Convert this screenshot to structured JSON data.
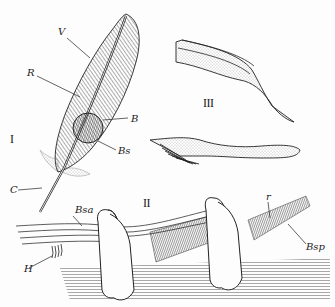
{
  "figure": {
    "panels": [
      {
        "id": "I",
        "label": "I",
        "description": "whole contour feather"
      },
      {
        "id": "II",
        "label": "II",
        "description": "barbs with interlocking barbules on section"
      },
      {
        "id": "III",
        "label": "III",
        "description": "individual barbules"
      }
    ],
    "labels": {
      "V": "V",
      "R": "R",
      "B": "B",
      "Bs": "Bs",
      "C": "C",
      "Bsa": "Bsa",
      "H": "H",
      "r": "r",
      "Bsp": "Bsp"
    },
    "colors": {
      "ink": "#1a1a1a",
      "paper": "#fdfdfd",
      "shade": "#8a8a8a"
    }
  }
}
